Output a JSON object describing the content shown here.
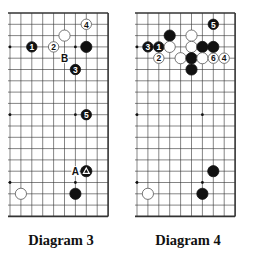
{
  "diagrams": [
    {
      "id": "diagram-3",
      "caption": "Diagram 3",
      "board": {
        "size": 19,
        "visible_cols": 10,
        "visible_rows": 19,
        "origin_x": 10,
        "origin_y": 13,
        "right_edge": true,
        "top_edge": true,
        "bottom_edge": true,
        "left_edge": false
      },
      "star_points": [
        [
          3,
          3
        ],
        [
          3,
          9
        ],
        [
          3,
          15
        ],
        [
          9,
          3
        ],
        [
          9,
          9
        ],
        [
          9,
          15
        ]
      ],
      "stones": [
        {
          "color": "white",
          "col": 2,
          "row": 1,
          "label": "4"
        },
        {
          "color": "white",
          "col": 4,
          "row": 2,
          "label": ""
        },
        {
          "color": "black",
          "col": 7,
          "row": 3,
          "label": "1"
        },
        {
          "color": "white",
          "col": 5,
          "row": 3,
          "label": "2"
        },
        {
          "color": "black",
          "col": 2,
          "row": 3,
          "label": ""
        },
        {
          "color": "black",
          "col": 3,
          "row": 5,
          "label": "3"
        },
        {
          "color": "black",
          "col": 2,
          "row": 9,
          "label": "5"
        },
        {
          "color": "black",
          "col": 2,
          "row": 14,
          "label": "△"
        },
        {
          "color": "black",
          "col": 3,
          "row": 16,
          "label": ""
        },
        {
          "color": "white",
          "col": 8,
          "row": 16,
          "label": ""
        }
      ],
      "marks": [
        {
          "text": "B",
          "col": 4,
          "row": 4
        },
        {
          "text": "A",
          "col": 3,
          "row": 14
        }
      ]
    },
    {
      "id": "diagram-4",
      "caption": "Diagram 4",
      "board": {
        "size": 19,
        "visible_cols": 10,
        "visible_rows": 19,
        "origin_x": 137,
        "origin_y": 13,
        "right_edge": true,
        "top_edge": true,
        "bottom_edge": true,
        "left_edge": false
      },
      "star_points": [
        [
          3,
          3
        ],
        [
          3,
          9
        ],
        [
          3,
          15
        ],
        [
          9,
          3
        ],
        [
          9,
          9
        ],
        [
          9,
          15
        ]
      ],
      "stones": [
        {
          "color": "black",
          "col": 2,
          "row": 1,
          "label": "5"
        },
        {
          "color": "black",
          "col": 6,
          "row": 2,
          "label": ""
        },
        {
          "color": "white",
          "col": 4,
          "row": 2,
          "label": ""
        },
        {
          "color": "black",
          "col": 8,
          "row": 3,
          "label": "3"
        },
        {
          "color": "black",
          "col": 7,
          "row": 3,
          "label": "1"
        },
        {
          "color": "white",
          "col": 6,
          "row": 3,
          "label": ""
        },
        {
          "color": "white",
          "col": 4,
          "row": 3,
          "label": ""
        },
        {
          "color": "black",
          "col": 3,
          "row": 3,
          "label": ""
        },
        {
          "color": "black",
          "col": 2,
          "row": 3,
          "label": ""
        },
        {
          "color": "white",
          "col": 7,
          "row": 4,
          "label": "2"
        },
        {
          "color": "white",
          "col": 5,
          "row": 4,
          "label": ""
        },
        {
          "color": "black",
          "col": 4,
          "row": 4,
          "label": ""
        },
        {
          "color": "white",
          "col": 3,
          "row": 4,
          "label": ""
        },
        {
          "color": "white",
          "col": 2,
          "row": 4,
          "label": "6"
        },
        {
          "color": "white",
          "col": 1,
          "row": 4,
          "label": "4"
        },
        {
          "color": "black",
          "col": 4,
          "row": 5,
          "label": ""
        },
        {
          "color": "black",
          "col": 2,
          "row": 14,
          "label": ""
        },
        {
          "color": "black",
          "col": 3,
          "row": 16,
          "label": ""
        },
        {
          "color": "white",
          "col": 8,
          "row": 16,
          "label": ""
        }
      ],
      "marks": []
    }
  ]
}
